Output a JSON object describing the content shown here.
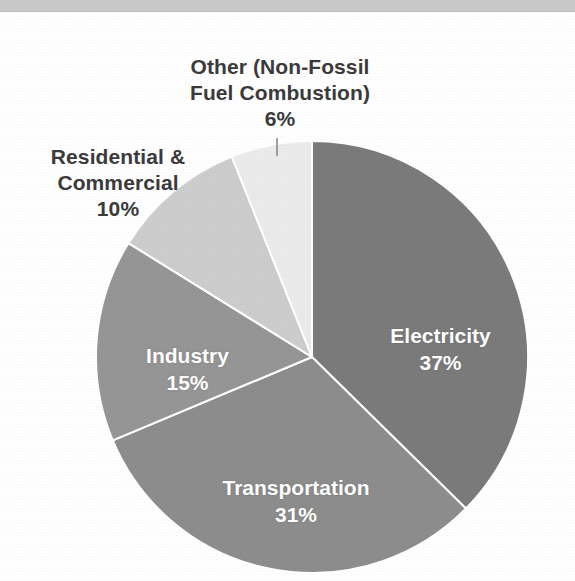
{
  "page": {
    "background_color": "#ffffff",
    "scan_artifact_color": "#c9c9c9"
  },
  "chart_data": {
    "type": "pie",
    "title": "",
    "subtitle": "",
    "xlabel": "",
    "ylabel": "",
    "grid": false,
    "legend_position": "none",
    "label_format": "name + percent",
    "start_angle_deg": 0,
    "direction": "clockwise",
    "total_percent": 99,
    "categories": [
      "Electricity",
      "Transportation",
      "Industry",
      "Residential & Commercial",
      "Other (Non-Fossil Fuel Combustion)"
    ],
    "values": [
      37,
      31,
      15,
      10,
      6
    ],
    "slices": [
      {
        "name": "Electricity",
        "label": "Electricity",
        "percent": 37,
        "percent_text": "37%",
        "color": "#7b7b7b",
        "label_placement": "inside",
        "label_color": "#ffffff"
      },
      {
        "name": "Transportation",
        "label": "Transportation",
        "percent": 31,
        "percent_text": "31%",
        "color": "#8d8d8d",
        "label_placement": "inside",
        "label_color": "#ffffff"
      },
      {
        "name": "Industry",
        "label": "Industry",
        "percent": 15,
        "percent_text": "15%",
        "color": "#969696",
        "label_placement": "inside",
        "label_color": "#ffffff"
      },
      {
        "name": "Residential & Commercial",
        "label": "Residential &\nCommercial",
        "percent": 10,
        "percent_text": "10%",
        "color": "#cdcdcd",
        "label_placement": "outside",
        "label_color": "#3b3b3b"
      },
      {
        "name": "Other (Non-Fossil Fuel Combustion)",
        "label": "Other (Non-Fossil\nFuel Combustion)",
        "percent": 6,
        "percent_text": "6%",
        "color": "#ebebeb",
        "label_placement": "outside",
        "label_color": "#3b3b3b",
        "has_leader_line": true
      }
    ]
  }
}
